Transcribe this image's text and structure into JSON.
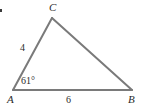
{
  "figure": {
    "kind": "geometry-triangle-diagram",
    "background_color": "#ffffff",
    "stroke_color": "#7a7a7a",
    "stroke_width": 2,
    "text_color": "#2b2b2b",
    "width": 141,
    "height": 110
  },
  "vertices": {
    "a": {
      "label": "A",
      "x": 13,
      "y": 90
    },
    "b": {
      "label": "B",
      "x": 132,
      "y": 90
    },
    "c": {
      "label": "C",
      "x": 52,
      "y": 18
    }
  },
  "sides": {
    "ac": {
      "length_label": "4"
    },
    "ab": {
      "length_label": "6"
    },
    "cb": {
      "length_label": ""
    }
  },
  "angles": {
    "at_a": {
      "label": "61°",
      "value": 61,
      "unit": "degrees"
    }
  },
  "marks": {
    "corner_dot": "bullet-mark"
  }
}
